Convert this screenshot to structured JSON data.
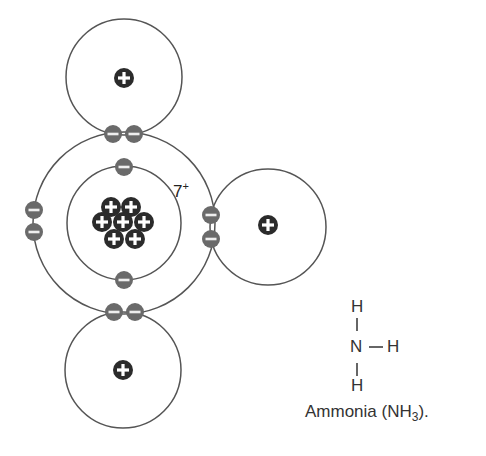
{
  "diagram": {
    "nitrogen": {
      "nucleus_charge": "7",
      "nucleus_charge_sign": "+",
      "protons": 7,
      "inner_shell_electrons": 2,
      "outer_shell_lone_pair": 2
    },
    "hydrogens": [
      {
        "position": "top",
        "symbol": "+"
      },
      {
        "position": "right",
        "symbol": "+"
      },
      {
        "position": "bottom",
        "symbol": "+"
      }
    ],
    "shared_pairs": 3,
    "colors": {
      "proton": "#2b2b2b",
      "electron": "#6a6a6a",
      "orbit": "#555555"
    }
  },
  "structural_formula": {
    "top_h": "H",
    "top_bond": "|",
    "center": "N",
    "right_bond": "—",
    "right_h": "H",
    "bottom_bond": "|",
    "bottom_h": "H"
  },
  "caption": {
    "text_prefix": "Ammonia (NH",
    "subscript": "3",
    "text_suffix": ")."
  }
}
